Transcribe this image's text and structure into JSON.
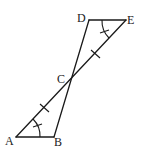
{
  "diagram": {
    "points": {
      "A": {
        "label": "A",
        "x": 16,
        "y": 137
      },
      "B": {
        "label": "B",
        "x": 54,
        "y": 137
      },
      "C": {
        "label": "C",
        "x": 70,
        "y": 79
      },
      "D": {
        "label": "D",
        "x": 89,
        "y": 20
      },
      "E": {
        "label": "E",
        "x": 126,
        "y": 20
      }
    },
    "segments": [
      "AB",
      "AE",
      "BD",
      "DE"
    ],
    "marks": {
      "equal_segments": [
        "AC",
        "CE"
      ],
      "equal_angles": [
        "BAC",
        "DEC"
      ]
    },
    "colors": {
      "stroke": "#1a1a1a",
      "background": "#ffffff"
    }
  }
}
